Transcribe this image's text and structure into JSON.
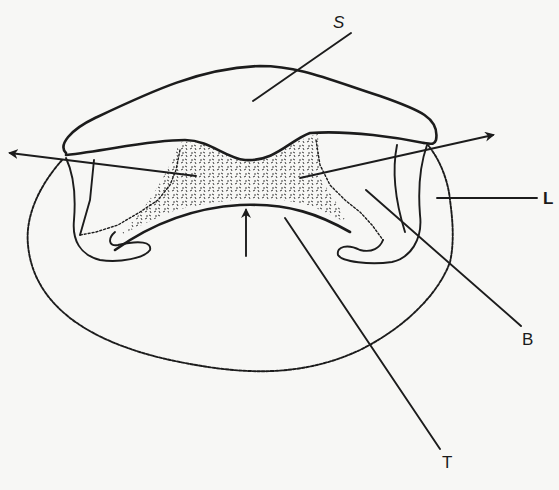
{
  "figure": {
    "ink_color": "#1c1c1c",
    "paper_color": "#f7f7f5",
    "labels": [
      {
        "id": "S",
        "text": "S",
        "x": 333,
        "y": 20,
        "leader": [
          [
            348,
            32
          ],
          [
            306,
            62
          ],
          [
            250,
            100
          ]
        ]
      },
      {
        "id": "L",
        "text": "L",
        "x": 542,
        "y": 198,
        "leader": [
          [
            437,
            198
          ],
          [
            537,
            198
          ]
        ]
      },
      {
        "id": "B",
        "text": "B",
        "x": 522,
        "y": 331,
        "leader": [
          [
            338,
            190
          ],
          [
            521,
            326
          ]
        ]
      },
      {
        "id": "T",
        "text": "T",
        "x": 443,
        "y": 454,
        "leader": [
          [
            266,
            218
          ],
          [
            440,
            449
          ]
        ]
      }
    ],
    "arrows": [
      {
        "name": "left-axis-arrow",
        "from": [
          196,
          158
        ],
        "to": [
          8,
          153
        ]
      },
      {
        "name": "right-axis-arrow",
        "from": [
          425,
          168
        ],
        "to": [
          495,
          135
        ]
      },
      {
        "name": "center-up-arrow",
        "from": [
          246,
          254
        ],
        "to": [
          246,
          208
        ]
      }
    ]
  }
}
